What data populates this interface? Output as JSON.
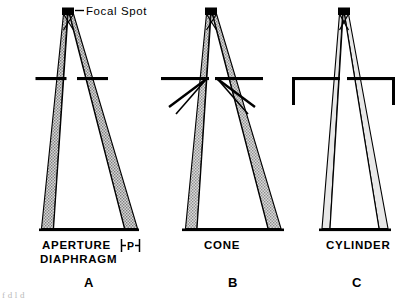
{
  "figure": {
    "focal_spot_label": "Focal Spot",
    "penumbra_symbol": "P",
    "panels": [
      {
        "id": "A",
        "panel_letter": "A",
        "device_label_line1": "APERTURE",
        "device_label_line2": "DIAPHRAGM",
        "device_label": "APERTURE DIAPHRAGM"
      },
      {
        "id": "B",
        "panel_letter": "B",
        "device_label_line1": "CONE",
        "device_label_line2": "",
        "device_label": "CONE"
      },
      {
        "id": "C",
        "panel_letter": "C",
        "device_label_line1": "CYLINDER",
        "device_label_line2": "",
        "device_label": "CYLINDER"
      }
    ],
    "colors": {
      "ink": "#000000",
      "paper": "#ffffff",
      "penumbra_fill": "#c9c9c9",
      "cut_text": "#b9b9b9"
    },
    "cut_caption_fragment": "f  d    l    d"
  }
}
